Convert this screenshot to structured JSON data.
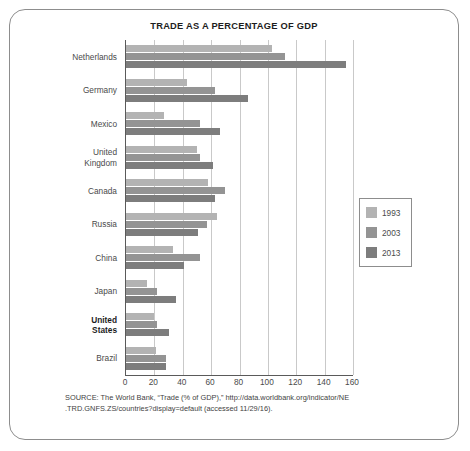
{
  "chart_data": {
    "type": "bar",
    "orientation": "horizontal",
    "title": "TRADE AS A PERCENTAGE OF GDP",
    "xlabel": "",
    "ylabel": "",
    "xlim": [
      0,
      160
    ],
    "xticks": [
      0,
      20,
      40,
      60,
      80,
      100,
      120,
      140,
      160
    ],
    "grid": true,
    "legend_position": "right",
    "categories": [
      "Netherlands",
      "Germany",
      "Mexico",
      "United Kingdom",
      "Canada",
      "Russia",
      "China",
      "Japan",
      "United States",
      "Brazil"
    ],
    "category_lines": [
      [
        "Netherlands"
      ],
      [
        "Germany"
      ],
      [
        "Mexico"
      ],
      [
        "United",
        "Kingdom"
      ],
      [
        "Canada"
      ],
      [
        "Russia"
      ],
      [
        "China"
      ],
      [
        "Japan"
      ],
      [
        "United",
        "States"
      ],
      [
        "Brazil"
      ]
    ],
    "highlighted_category": "United States",
    "series": [
      {
        "name": "1993",
        "color": "#b3b3b3",
        "values": [
          103,
          43,
          27,
          50,
          58,
          64,
          33,
          15,
          20,
          21
        ]
      },
      {
        "name": "2003",
        "color": "#949494",
        "values": [
          112,
          63,
          52,
          52,
          70,
          57,
          52,
          22,
          22,
          28
        ]
      },
      {
        "name": "2013",
        "color": "#7d7d7d",
        "values": [
          155,
          86,
          66,
          61,
          63,
          51,
          41,
          35,
          30,
          28
        ]
      }
    ]
  },
  "legend": {
    "items": [
      {
        "label": "1993",
        "color": "#b3b3b3"
      },
      {
        "label": "2003",
        "color": "#949494"
      },
      {
        "label": "2013",
        "color": "#7d7d7d"
      }
    ]
  },
  "source": {
    "line1": "SOURCE: The World Bank, “Trade (% of GDP),” http://data.worldbank.org/indicator/NE",
    "line2": ".TRD.GNFS.ZS/countries?display=default (accessed 11/29/16)."
  }
}
